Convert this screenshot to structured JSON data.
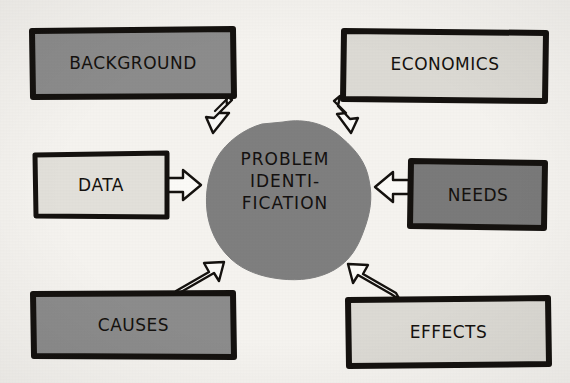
{
  "diagram": {
    "style": "hand-drawn marker sketch",
    "background_color": "#f5f3ef",
    "ink_color": "#15120f"
  },
  "center": {
    "shape": "blob",
    "fill": "#7f7f7f",
    "lines": [
      "PROBLEM",
      "IDENTI-",
      "FICATION"
    ],
    "line1": "PROBLEM",
    "line2": "IDENTI-",
    "line3": "FICATION"
  },
  "boxes": [
    {
      "id": "background",
      "label": "BACKGROUND",
      "fill": "#8c8c8c",
      "position": "top-left"
    },
    {
      "id": "economics",
      "label": "ECONOMICS",
      "fill": "#dcdad4",
      "position": "top-right"
    },
    {
      "id": "data",
      "label": "DATA",
      "fill": "#e2e0da",
      "position": "middle-left"
    },
    {
      "id": "needs",
      "label": "NEEDS",
      "fill": "#7a7a7a",
      "position": "middle-right"
    },
    {
      "id": "causes",
      "label": "CAUSES",
      "fill": "#8c8c8c",
      "position": "bottom-left"
    },
    {
      "id": "effects",
      "label": "EFFECTS",
      "fill": "#dcdad4",
      "position": "bottom-right"
    }
  ],
  "arrows": [
    {
      "id": "background-to-center",
      "from": "background",
      "to": "center",
      "direction": "down-right",
      "style": "hollow-block-arrow"
    },
    {
      "id": "economics-to-center",
      "from": "economics",
      "to": "center",
      "direction": "down-left",
      "style": "hollow-block-arrow"
    },
    {
      "id": "data-to-center",
      "from": "data",
      "to": "center",
      "direction": "right",
      "style": "hollow-block-arrow"
    },
    {
      "id": "needs-to-center",
      "from": "needs",
      "to": "center",
      "direction": "left",
      "style": "hollow-block-arrow"
    },
    {
      "id": "causes-to-center",
      "from": "causes",
      "to": "center",
      "direction": "up-right",
      "style": "hollow-block-arrow"
    },
    {
      "id": "effects-to-center",
      "from": "effects",
      "to": "center",
      "direction": "up-left",
      "style": "hollow-block-arrow"
    }
  ]
}
